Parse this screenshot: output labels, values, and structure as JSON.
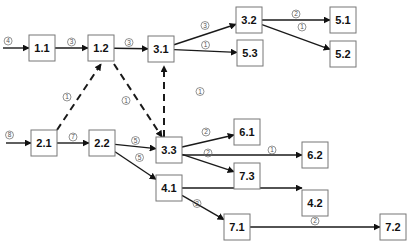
{
  "diagram": {
    "type": "directed-graph",
    "nodes": [
      {
        "id": "1.1",
        "label": "1.1"
      },
      {
        "id": "1.2",
        "label": "1.2"
      },
      {
        "id": "2.1",
        "label": "2.1"
      },
      {
        "id": "2.2",
        "label": "2.2"
      },
      {
        "id": "3.1",
        "label": "3.1"
      },
      {
        "id": "3.2",
        "label": "3.2"
      },
      {
        "id": "3.3",
        "label": "3.3"
      },
      {
        "id": "4.1",
        "label": "4.1"
      },
      {
        "id": "4.2",
        "label": "4.2"
      },
      {
        "id": "5.1",
        "label": "5.1"
      },
      {
        "id": "5.2",
        "label": "5.2"
      },
      {
        "id": "5.3",
        "label": "5.3"
      },
      {
        "id": "6.1",
        "label": "6.1"
      },
      {
        "id": "6.2",
        "label": "6.2"
      },
      {
        "id": "7.1",
        "label": "7.1"
      },
      {
        "id": "7.2",
        "label": "7.2"
      },
      {
        "id": "7.3",
        "label": "7.3"
      }
    ],
    "edges": [
      {
        "from": null,
        "to": "1.1",
        "weight": "4",
        "style": "solid"
      },
      {
        "from": null,
        "to": "2.1",
        "weight": "8",
        "style": "solid"
      },
      {
        "from": "1.1",
        "to": "1.2",
        "weight": "3",
        "style": "solid"
      },
      {
        "from": "1.2",
        "to": "3.1",
        "weight": "3",
        "style": "solid"
      },
      {
        "from": "2.1",
        "to": "1.2",
        "weight": "1",
        "style": "dashed"
      },
      {
        "from": "1.2",
        "to": "3.3",
        "weight": "1",
        "style": "dashed"
      },
      {
        "from": "3.3",
        "to": "3.1",
        "weight": "1",
        "style": "dashed"
      },
      {
        "from": "2.1",
        "to": "2.2",
        "weight": "7",
        "style": "solid"
      },
      {
        "from": "2.2",
        "to": "3.3",
        "weight": "5",
        "style": "solid"
      },
      {
        "from": "2.2",
        "to": "4.1",
        "weight": "5",
        "style": "solid"
      },
      {
        "from": "3.1",
        "to": "3.2",
        "weight": "3",
        "style": "solid"
      },
      {
        "from": "3.1",
        "to": "5.3",
        "weight": "1",
        "style": "solid"
      },
      {
        "from": "3.2",
        "to": "5.1",
        "weight": "2",
        "style": "solid"
      },
      {
        "from": "3.2",
        "to": "5.2",
        "weight": "1",
        "style": "solid"
      },
      {
        "from": "3.3",
        "to": "6.1",
        "weight": "2",
        "style": "solid"
      },
      {
        "from": "3.3",
        "to": "6.2",
        "weight": "1",
        "style": "solid"
      },
      {
        "from": "3.3",
        "to": "7.3",
        "weight": "2",
        "style": "solid"
      },
      {
        "from": "4.1",
        "to": "4.2",
        "weight": "3",
        "style": "solid"
      },
      {
        "from": "4.1",
        "to": "7.1",
        "weight": "2",
        "style": "solid"
      },
      {
        "from": "7.1",
        "to": "7.2",
        "weight": "2",
        "style": "solid"
      }
    ]
  }
}
